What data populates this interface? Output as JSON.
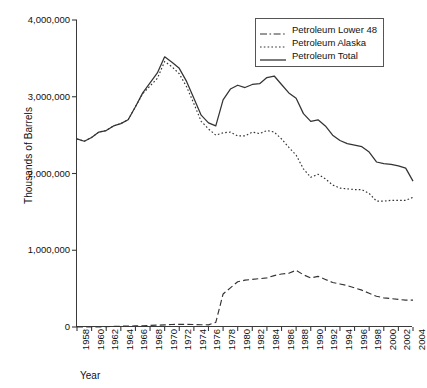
{
  "chart_data": {
    "type": "line",
    "title": "",
    "xlabel": "Year",
    "ylabel": "Thousands of Barrels",
    "xlim": [
      1958,
      2004
    ],
    "ylim": [
      0,
      4000000
    ],
    "grid": false,
    "legend_position": "top-right",
    "y_ticks": [
      "0",
      "1,000,000",
      "2,000,000",
      "3,000,000",
      "4,000,000"
    ],
    "y_tick_values": [
      0,
      1000000,
      2000000,
      3000000,
      4000000
    ],
    "x_ticks": [
      "1958",
      "1960",
      "1962",
      "1964",
      "1966",
      "1968",
      "1970",
      "1972",
      "1974",
      "1976",
      "1978",
      "1980",
      "1982",
      "1984",
      "1986",
      "1988",
      "1990",
      "1992",
      "1994",
      "1996",
      "1998",
      "2000",
      "2002",
      "2004"
    ],
    "x": [
      1958,
      1959,
      1960,
      1961,
      1962,
      1963,
      1964,
      1965,
      1966,
      1967,
      1968,
      1969,
      1970,
      1971,
      1972,
      1973,
      1974,
      1975,
      1976,
      1977,
      1978,
      1979,
      1980,
      1981,
      1982,
      1983,
      1984,
      1985,
      1986,
      1987,
      1988,
      1989,
      1990,
      1991,
      1992,
      1993,
      1994,
      1995,
      1996,
      1997,
      1998,
      1999,
      2000,
      2001,
      2002,
      2003,
      2004
    ],
    "series": [
      {
        "name": "Petroleum Total",
        "style": "solid",
        "color": "#333333",
        "values": [
          2450000,
          2420000,
          2470000,
          2540000,
          2560000,
          2620000,
          2650000,
          2700000,
          2870000,
          3050000,
          3180000,
          3310000,
          3520000,
          3450000,
          3370000,
          3200000,
          2980000,
          2760000,
          2660000,
          2620000,
          2960000,
          3100000,
          3150000,
          3120000,
          3160000,
          3170000,
          3250000,
          3270000,
          3160000,
          3050000,
          2980000,
          2780000,
          2680000,
          2700000,
          2620000,
          2500000,
          2430000,
          2390000,
          2370000,
          2350000,
          2280000,
          2150000,
          2130000,
          2120000,
          2100000,
          2070000,
          1900000
        ]
      },
      {
        "name": "Petroleum Lower 48",
        "style": "dotted",
        "color": "#333333",
        "values": [
          2450000,
          2420000,
          2470000,
          2540000,
          2560000,
          2620000,
          2650000,
          2700000,
          2870000,
          3040000,
          3140000,
          3240000,
          3460000,
          3390000,
          3300000,
          3130000,
          2910000,
          2680000,
          2580000,
          2500000,
          2530000,
          2540000,
          2490000,
          2490000,
          2540000,
          2520000,
          2560000,
          2540000,
          2450000,
          2340000,
          2240000,
          2060000,
          1950000,
          1990000,
          1930000,
          1850000,
          1810000,
          1800000,
          1790000,
          1790000,
          1740000,
          1640000,
          1640000,
          1650000,
          1650000,
          1650000,
          1690000
        ]
      },
      {
        "name": "Petroleum Alaska",
        "style": "dashed",
        "color": "#333333",
        "values": [
          0,
          0,
          0,
          0,
          5000,
          8000,
          10000,
          12000,
          14000,
          16000,
          20000,
          24000,
          28000,
          32000,
          35000,
          34000,
          32000,
          30000,
          28000,
          60000,
          430000,
          510000,
          590000,
          610000,
          620000,
          630000,
          640000,
          670000,
          690000,
          700000,
          740000,
          680000,
          640000,
          660000,
          620000,
          580000,
          560000,
          540000,
          510000,
          480000,
          440000,
          400000,
          380000,
          370000,
          360000,
          350000,
          350000
        ]
      }
    ]
  },
  "legend": {
    "entries": [
      {
        "label": "Petroleum Lower 48",
        "style": "dashdot"
      },
      {
        "label": "Petroleum Alaska",
        "style": "dotted"
      },
      {
        "label": "Petroleum Total",
        "style": "solid"
      }
    ]
  }
}
